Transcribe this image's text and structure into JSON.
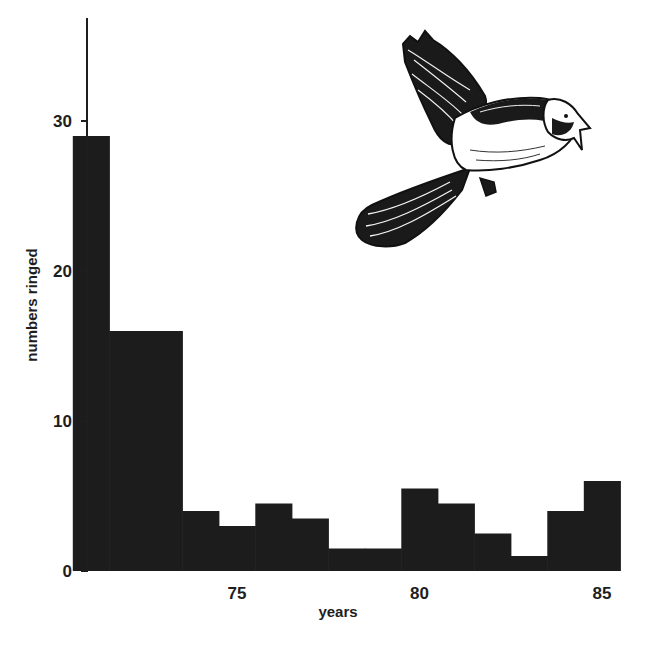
{
  "chart_data": {
    "type": "bar",
    "style": "histogram (contiguous bars, no gaps)",
    "title": "",
    "xlabel": "years",
    "ylabel": "numbers ringed",
    "x_tick_labels": [
      "75",
      "80",
      "85"
    ],
    "y_tick_labels": [
      "0",
      "10",
      "20",
      "30"
    ],
    "ylim": [
      0,
      37
    ],
    "xlim": [
      70.5,
      85.5
    ],
    "grid": false,
    "legend": null,
    "bar_color": "#1c1c1c",
    "categories": [
      "71",
      "72",
      "73",
      "74",
      "75",
      "76",
      "77",
      "78",
      "79",
      "80",
      "81",
      "82",
      "83",
      "84",
      "85"
    ],
    "values": [
      29,
      16,
      16,
      4,
      3,
      4.5,
      3.5,
      1.5,
      1.5,
      5.5,
      4.5,
      2.5,
      1,
      4,
      6
    ],
    "illustration": "pen-and-ink drawing of a small songbird in flight (upper right)"
  },
  "axes": {
    "x_title": "years",
    "y_title": "numbers ringed",
    "x_ticks": [
      {
        "label": "75",
        "value": 75
      },
      {
        "label": "80",
        "value": 80
      },
      {
        "label": "85",
        "value": 85
      }
    ],
    "y_ticks": [
      {
        "label": "0",
        "value": 0
      },
      {
        "label": "10",
        "value": 10
      },
      {
        "label": "20",
        "value": 20
      },
      {
        "label": "30",
        "value": 30
      }
    ]
  },
  "colors": {
    "background": "#ffffff",
    "bars": "#1c1c1c",
    "axis": "#1e1e1e",
    "text": "#1e1e1e"
  }
}
